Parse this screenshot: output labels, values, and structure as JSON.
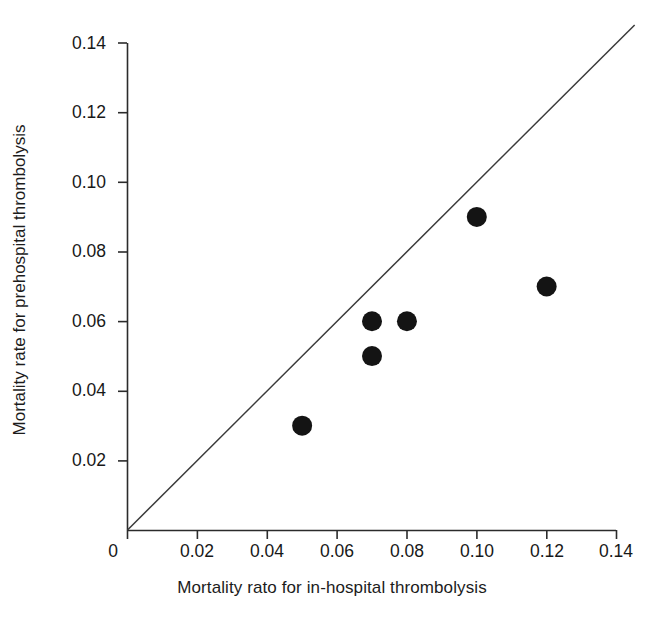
{
  "chart_data": {
    "type": "scatter",
    "title": "",
    "xlabel": "Mortality rato for in-hospital thrombolysis",
    "ylabel": "Mortality rate for prehospital thrombolysis",
    "xlim": [
      0,
      0.14
    ],
    "ylim": [
      0,
      0.14
    ],
    "grid": false,
    "legend": "none",
    "xticks": [
      0,
      0.02,
      0.04,
      0.06,
      0.08,
      0.1,
      0.12,
      0.14
    ],
    "xticklabels": [
      "0",
      "0.02",
      "0.04",
      "0.06",
      "0.08",
      "0.10",
      "0.12",
      "0.14"
    ],
    "yticks": [
      0.02,
      0.04,
      0.06,
      0.08,
      0.1,
      0.12,
      0.14
    ],
    "yticklabels": [
      "0.02",
      "0.04",
      "0.06",
      "0.08",
      "0.10",
      "0.12",
      "0.14"
    ],
    "points": [
      {
        "x": 0.05,
        "y": 0.03
      },
      {
        "x": 0.07,
        "y": 0.06
      },
      {
        "x": 0.07,
        "y": 0.05
      },
      {
        "x": 0.08,
        "y": 0.06
      },
      {
        "x": 0.1,
        "y": 0.09
      },
      {
        "x": 0.12,
        "y": 0.07
      }
    ],
    "reference_line": {
      "name": "line-of-identity",
      "from": [
        0,
        0
      ],
      "to": [
        0.1452,
        0.1452
      ],
      "slope": 1,
      "intercept": 0
    },
    "marker": {
      "shape": "circle",
      "color": "#141414",
      "radius_px": 10
    },
    "colors": {
      "axis": "#2b2b2b",
      "line": "#3a3a3a",
      "marker": "#141414",
      "background": "#ffffff",
      "text": "#1a1a1a"
    }
  }
}
